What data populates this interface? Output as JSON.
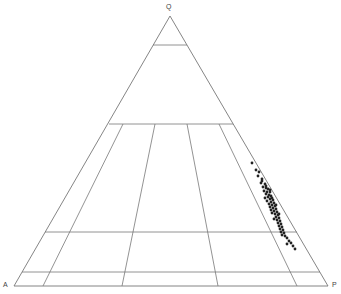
{
  "diagram": {
    "type": "QAPF ternary diagram",
    "vertices": {
      "top": "Q",
      "left": "A",
      "right": "P"
    },
    "line_color": "#777777",
    "point_color": "#222222",
    "geometry": {
      "apex": [
        170,
        16
      ],
      "left": [
        14,
        286
      ],
      "right": [
        328,
        286
      ]
    },
    "horizontal_divisions": [
      {
        "y": 45,
        "x1": 153,
        "x2": 187
      },
      {
        "y": 124,
        "x1": 109,
        "x2": 233
      },
      {
        "y": 232,
        "x1": 45,
        "x2": 297
      },
      {
        "y": 272,
        "x1": 22,
        "x2": 320
      }
    ],
    "radial_lines": [
      {
        "x_top": 123,
        "y_top": 124,
        "x_bot": 43,
        "y_bot": 286
      },
      {
        "x_top": 155,
        "y_top": 124,
        "x_bot": 122,
        "y_bot": 286
      },
      {
        "x_top": 187,
        "y_top": 124,
        "x_bot": 218,
        "y_bot": 286
      },
      {
        "x_top": 219,
        "y_top": 124,
        "x_bot": 297,
        "y_bot": 286
      }
    ],
    "data_points": [
      [
        252,
        163
      ],
      [
        256,
        170
      ],
      [
        259,
        172
      ],
      [
        258,
        176
      ],
      [
        262,
        179
      ],
      [
        261,
        183
      ],
      [
        265,
        184
      ],
      [
        263,
        187
      ],
      [
        266,
        188
      ],
      [
        268,
        189
      ],
      [
        264,
        191
      ],
      [
        267,
        192
      ],
      [
        270,
        192
      ],
      [
        266,
        194
      ],
      [
        269,
        195
      ],
      [
        271,
        196
      ],
      [
        268,
        197
      ],
      [
        272,
        198
      ],
      [
        265,
        198
      ],
      [
        270,
        199
      ],
      [
        273,
        200
      ],
      [
        267,
        201
      ],
      [
        271,
        202
      ],
      [
        274,
        203
      ],
      [
        269,
        204
      ],
      [
        272,
        205
      ],
      [
        275,
        206
      ],
      [
        270,
        207
      ],
      [
        273,
        208
      ],
      [
        276,
        209
      ],
      [
        271,
        210
      ],
      [
        274,
        211
      ],
      [
        277,
        212
      ],
      [
        272,
        213
      ],
      [
        275,
        214
      ],
      [
        278,
        215
      ],
      [
        276,
        217
      ],
      [
        279,
        218
      ],
      [
        274,
        219
      ],
      [
        277,
        220
      ],
      [
        280,
        221
      ],
      [
        278,
        223
      ],
      [
        281,
        224
      ],
      [
        279,
        226
      ],
      [
        282,
        227
      ],
      [
        280,
        229
      ],
      [
        283,
        230
      ],
      [
        281,
        232
      ],
      [
        284,
        233
      ],
      [
        282,
        235
      ],
      [
        285,
        236
      ],
      [
        287,
        238
      ],
      [
        289,
        241
      ],
      [
        291,
        243
      ],
      [
        293,
        246
      ],
      [
        287,
        244
      ],
      [
        295,
        249
      ],
      [
        262,
        181
      ],
      [
        266,
        186
      ],
      [
        270,
        190
      ],
      [
        276,
        205
      ],
      [
        279,
        214
      ]
    ]
  }
}
